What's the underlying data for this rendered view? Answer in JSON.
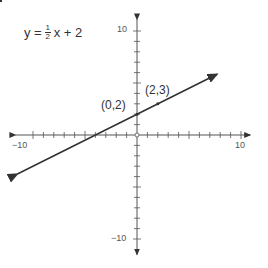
{
  "chart_data": {
    "type": "line",
    "title": "",
    "equation": {
      "lhs": "y =",
      "frac_num": "1",
      "frac_den": "2",
      "rhs": "x + 2"
    },
    "xlabel": "",
    "ylabel": "",
    "xlim": [
      -11.5,
      10.5
    ],
    "ylim": [
      -11.5,
      11.5
    ],
    "grid": false,
    "x_tick_labels": {
      "min": "−10",
      "max": "10"
    },
    "y_tick_labels": {
      "min": "−10",
      "max": "10"
    },
    "series": [
      {
        "name": "y = 1/2 x + 2",
        "slope": 0.5,
        "intercept": 2,
        "x": [
          -11.5,
          7.7
        ],
        "y": [
          -3.75,
          5.85
        ]
      }
    ],
    "points": [
      {
        "x": 0,
        "y": 2,
        "label": "(0,2)"
      },
      {
        "x": 2,
        "y": 3,
        "label": "(2,3)"
      }
    ],
    "colors": {
      "axis": "#555555",
      "line": "#333333",
      "text": "#444444"
    }
  }
}
